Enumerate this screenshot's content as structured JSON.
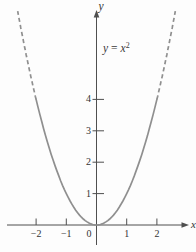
{
  "chart_data": {
    "type": "line",
    "function": "y = x^2",
    "key_points": {
      "x": [
        -2,
        -1,
        0,
        1,
        2
      ],
      "y": [
        4,
        1,
        0,
        1,
        4
      ]
    },
    "xlabel": "x",
    "ylabel": "y",
    "origin_label": "0",
    "xlim": [
      -2.95,
      3.3
    ],
    "ylim": [
      -0.85,
      6.85
    ],
    "grid": false,
    "legend": "none",
    "x_ticks": [
      {
        "value": -2,
        "label": "−2"
      },
      {
        "value": -1,
        "label": "−1"
      },
      {
        "value": 1,
        "label": "1"
      },
      {
        "value": 2,
        "label": "2"
      }
    ],
    "y_ticks": [
      {
        "value": 1,
        "label": "1"
      },
      {
        "value": 2,
        "label": "2"
      },
      {
        "value": 3,
        "label": "3"
      },
      {
        "value": 4,
        "label": "4"
      }
    ],
    "annotation": {
      "lhs": "y",
      "eq": "=",
      "base": "x",
      "exponent": "2"
    },
    "series": [
      {
        "name": "y = x²",
        "color": "#8f8f8f",
        "stroke_width": 1.7,
        "solid_domain": [
          -2,
          2
        ],
        "dashed_domains": [
          [
            -2,
            -2.61
          ],
          [
            2,
            2.61
          ]
        ],
        "dash_pattern": "4.2 3"
      }
    ],
    "style": {
      "axis_color": "#4f4f4f",
      "text_color": "#333333",
      "background": "#fdfdfd"
    }
  }
}
